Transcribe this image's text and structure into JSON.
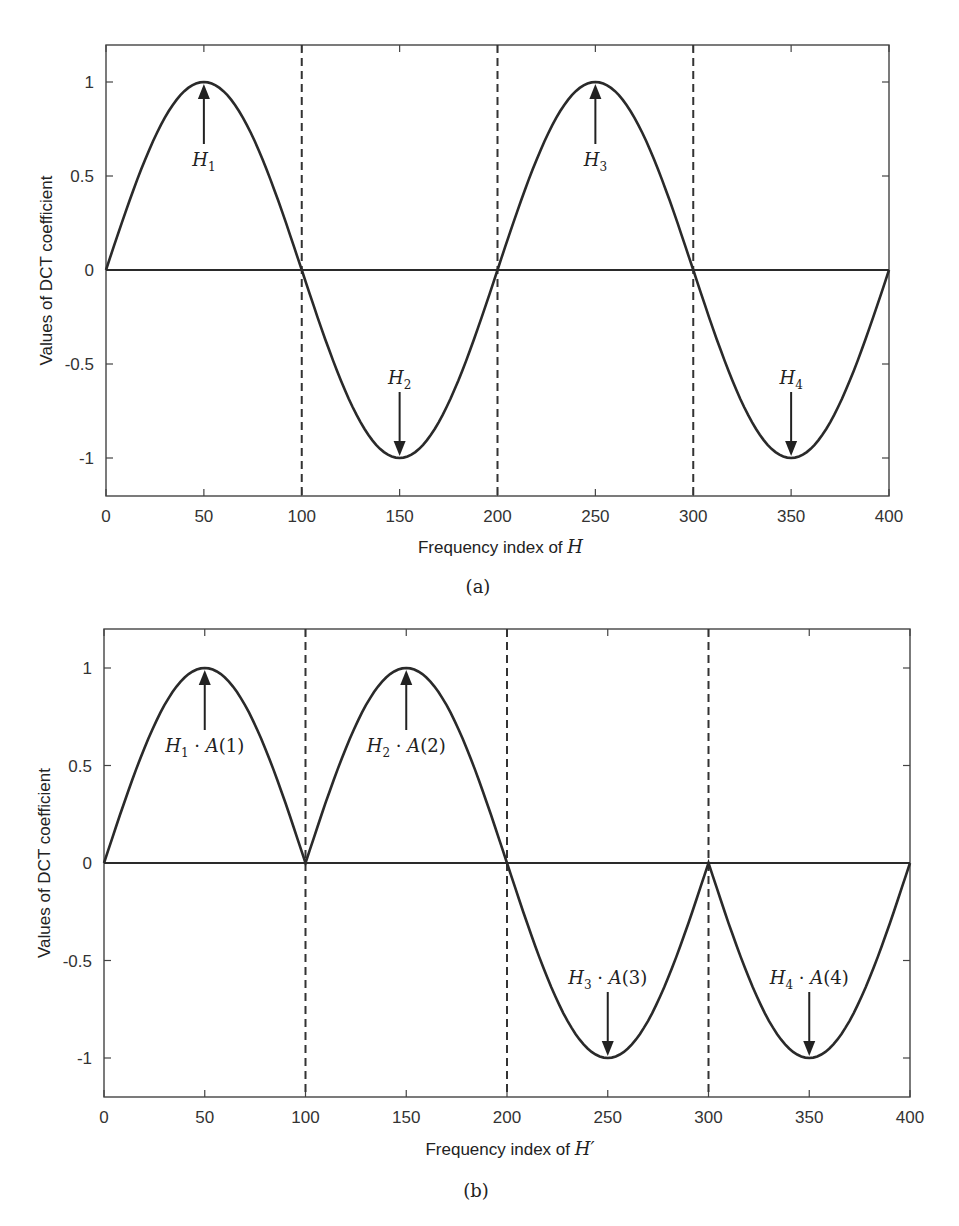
{
  "chart_data": [
    {
      "type": "line",
      "panel": "(a)",
      "title": "",
      "xlabel": "Frequency index of H",
      "xlabel_text": "Frequency index of ",
      "xlabel_symbol": "H",
      "ylabel": "Values of DCT coefficient",
      "xlim": [
        0,
        400
      ],
      "ylim": [
        -1.2,
        1.2
      ],
      "xticks": [
        "0",
        "50",
        "100",
        "150",
        "200",
        "250",
        "300",
        "350",
        "400"
      ],
      "yticks": [
        "1",
        "0.5",
        "0",
        "-0.5",
        "-1"
      ],
      "grid": false,
      "series": [
        {
          "name": "DCT coefficients",
          "x": [
            0,
            25,
            50,
            75,
            100,
            125,
            150,
            175,
            200,
            225,
            250,
            275,
            300,
            325,
            350,
            375,
            400
          ],
          "values": [
            0,
            0.707,
            1,
            0.707,
            0,
            -0.707,
            -1,
            -0.707,
            0,
            0.707,
            1,
            0.707,
            0,
            -0.707,
            -1,
            -0.707,
            0
          ]
        }
      ],
      "reference_lines": {
        "vertical_dashed": [
          100,
          200,
          300
        ],
        "horizontal": [
          0
        ]
      },
      "annotations": [
        {
          "label": "H",
          "sub": "1",
          "suffix": "",
          "x": 50,
          "y": 1,
          "arrow": "up"
        },
        {
          "label": "H",
          "sub": "2",
          "suffix": "",
          "x": 150,
          "y": -1,
          "arrow": "down"
        },
        {
          "label": "H",
          "sub": "3",
          "suffix": "",
          "x": 250,
          "y": 1,
          "arrow": "up"
        },
        {
          "label": "H",
          "sub": "4",
          "suffix": "",
          "x": 350,
          "y": -1,
          "arrow": "down"
        }
      ]
    },
    {
      "type": "line",
      "panel": "(b)",
      "title": "",
      "xlabel": "Frequency index of H'",
      "xlabel_text": "Frequency index of ",
      "xlabel_symbol": "H′",
      "ylabel": "Values of DCT coefficient",
      "xlim": [
        0,
        400
      ],
      "ylim": [
        -1.2,
        1.2
      ],
      "xticks": [
        "0",
        "50",
        "100",
        "150",
        "200",
        "250",
        "300",
        "350",
        "400"
      ],
      "yticks": [
        "1",
        "0.5",
        "0",
        "-0.5",
        "-1"
      ],
      "grid": false,
      "series": [
        {
          "name": "Modified DCT coefficients",
          "x": [
            0,
            25,
            50,
            75,
            100,
            125,
            150,
            175,
            200,
            225,
            250,
            275,
            300,
            325,
            350,
            375,
            400
          ],
          "values": [
            0,
            0.707,
            1,
            0.707,
            0,
            0.707,
            1,
            0.707,
            0,
            -0.707,
            -1,
            -0.707,
            0,
            -0.707,
            -1,
            -0.707,
            0
          ]
        }
      ],
      "reference_lines": {
        "vertical_dashed": [
          100,
          200,
          300
        ],
        "horizontal": [
          0
        ]
      },
      "annotations": [
        {
          "label": "H",
          "sub": "1",
          "suffix": " · A(1)",
          "x": 50,
          "y": 1,
          "arrow": "up"
        },
        {
          "label": "H",
          "sub": "2",
          "suffix": " · A(2)",
          "x": 150,
          "y": 1,
          "arrow": "up"
        },
        {
          "label": "H",
          "sub": "3",
          "suffix": " · A(3)",
          "x": 250,
          "y": -1,
          "arrow": "down"
        },
        {
          "label": "H",
          "sub": "4",
          "suffix": " · A(4)",
          "x": 350,
          "y": -1,
          "arrow": "down"
        }
      ]
    }
  ],
  "captions": {
    "a": "(a)",
    "b": "(b)"
  }
}
